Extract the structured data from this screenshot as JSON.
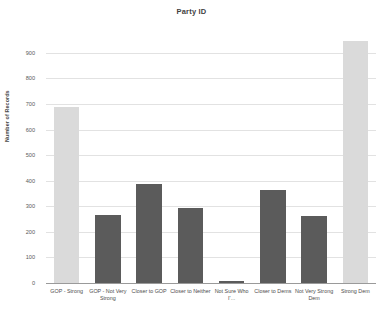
{
  "chart_data": {
    "type": "bar",
    "title": "Party ID",
    "xlabel": "",
    "ylabel": "Number of Records",
    "ylim": [
      0,
      950
    ],
    "yticks": [
      0,
      100,
      200,
      300,
      400,
      500,
      600,
      700,
      800,
      900
    ],
    "grid": true,
    "legend": "none",
    "categories": [
      "GOP - Strong",
      "GOP - Not Very Strong",
      "Closer to GOP",
      "Closer to Neither",
      "Not Sure Who I'...",
      "Closer to Dems",
      "Not Very Strong Dem",
      "Strong Dem"
    ],
    "values": [
      690,
      265,
      388,
      295,
      8,
      363,
      263,
      948
    ],
    "bar_colors": [
      "#dadada",
      "#5b5b5b",
      "#5b5b5b",
      "#5b5b5b",
      "#5b5b5b",
      "#5b5b5b",
      "#5b5b5b",
      "#dadada"
    ]
  },
  "colors": {
    "light_bar": "#dadada",
    "dark_bar": "#5b5b5b",
    "gridline": "#e2e2e2",
    "axis": "#9a9a9a",
    "text": "#4d4d4d",
    "background": "#ffffff"
  }
}
